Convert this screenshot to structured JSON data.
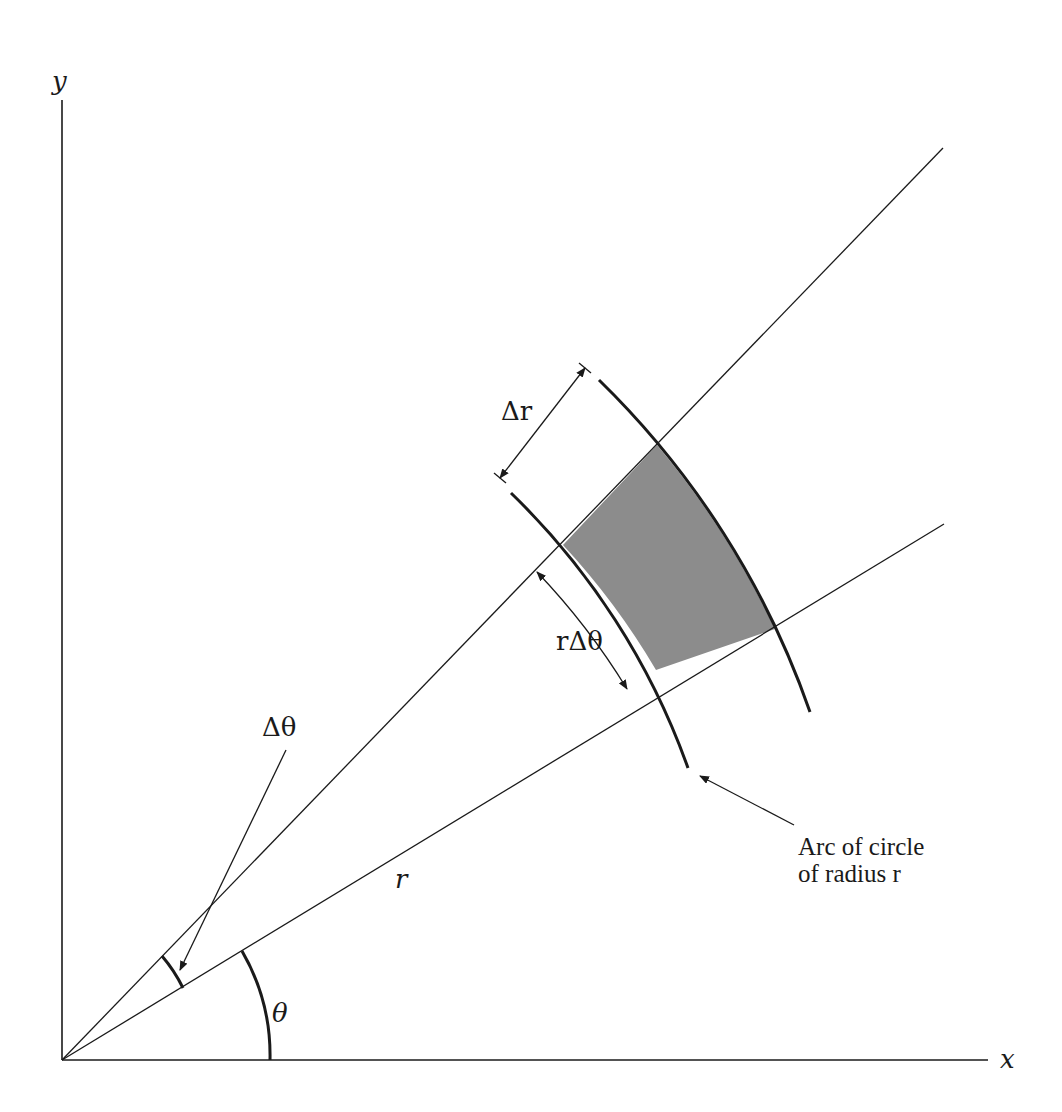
{
  "figure": {
    "axes": {
      "x_label": "x",
      "y_label": "y"
    },
    "labels": {
      "delta_r": "Δr",
      "r_delta_theta": "rΔθ",
      "delta_theta": "Δθ",
      "theta": "θ",
      "r": "r",
      "arc_caption_line1": "Arc of circle",
      "arc_caption_line2": "of radius r"
    },
    "colors": {
      "ink": "#1a1a1a",
      "shaded_region": "#8c8c8c",
      "background": "#ffffff"
    }
  }
}
